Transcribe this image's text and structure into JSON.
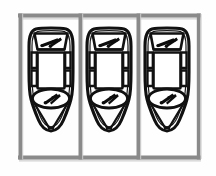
{
  "image": {
    "title": "Three cars parked in adjacent parking bays (top-down plan view)",
    "type": "line-drawing",
    "width": 216,
    "height": 176,
    "background_color": "#fefefe"
  },
  "colors": {
    "background": "#fefefe",
    "parking_line": "#8c8c8c",
    "parking_line_shadow": "#b9b9b9",
    "car_outline": "#111111",
    "car_body_fill": "#fdfdfd",
    "glass_fill": "#ffffff",
    "wiper": "#0d0d0d"
  },
  "parking_lot": {
    "label": "parking-lot",
    "bay_count": 3,
    "top_rail": {
      "label": "top-rail",
      "y": 14,
      "x1": 18,
      "x2": 200,
      "thickness": 4
    },
    "bottom_rail": {
      "label": "bottom-rail",
      "y": 156,
      "x1": 18,
      "x2": 200,
      "thickness": 4
    },
    "dividers": [
      {
        "label": "divider-left-edge",
        "x": 20
      },
      {
        "label": "divider-1",
        "x": 80
      },
      {
        "label": "divider-2",
        "x": 138
      },
      {
        "label": "divider-right-edge",
        "x": 198
      }
    ],
    "bays": [
      {
        "label": "bay-1",
        "occupied": true,
        "vehicle": "car-1",
        "x_center": 50
      },
      {
        "label": "bay-2",
        "occupied": true,
        "vehicle": "car-2",
        "x_center": 109
      },
      {
        "label": "bay-3",
        "occupied": true,
        "vehicle": "car-3",
        "x_center": 168
      }
    ]
  },
  "cars": [
    {
      "id": "car-1",
      "label": "Car in bay 1",
      "x_center": 51,
      "top": 30,
      "bottom": 144,
      "half_width": 25,
      "parts": {
        "body": "car-body",
        "windshield": "windshield",
        "front_wiper": "front-wiper",
        "roof": "roof-panel",
        "side_windows": "side-windows",
        "rear_window": "rear-window",
        "rear_wiper": "rear-wiper",
        "trunk": "trunk-panel"
      }
    },
    {
      "id": "car-2",
      "label": "Car in bay 2",
      "x_center": 109,
      "top": 30,
      "bottom": 144,
      "half_width": 25,
      "parts": {
        "body": "car-body",
        "windshield": "windshield",
        "front_wiper": "front-wiper",
        "roof": "roof-panel",
        "side_windows": "side-windows",
        "rear_window": "rear-window",
        "rear_wiper": "rear-wiper",
        "trunk": "trunk-panel"
      }
    },
    {
      "id": "car-3",
      "label": "Car in bay 3",
      "x_center": 167,
      "top": 30,
      "bottom": 144,
      "half_width": 25,
      "parts": {
        "body": "car-body",
        "windshield": "windshield",
        "front_wiper": "front-wiper",
        "roof": "roof-panel",
        "side_windows": "side-windows",
        "rear_window": "rear-window",
        "rear_wiper": "rear-wiper",
        "trunk": "trunk-panel"
      }
    }
  ]
}
